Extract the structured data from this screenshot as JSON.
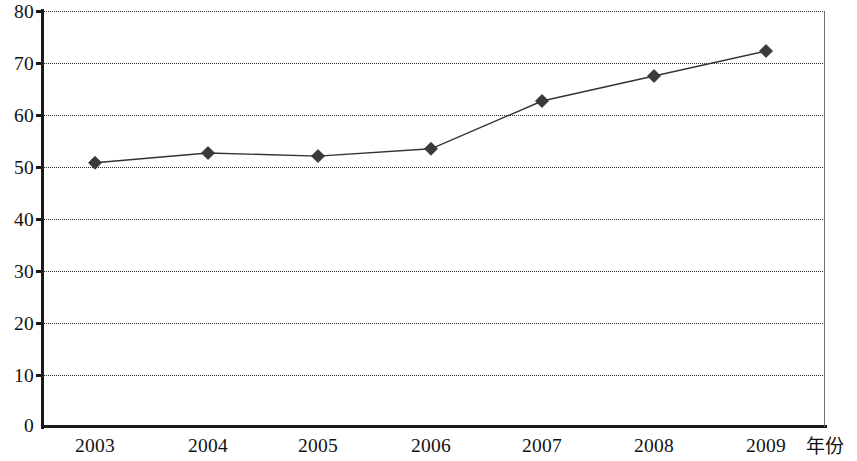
{
  "chart_data": {
    "type": "line",
    "title": "",
    "subtitle": "",
    "xlabel": "年份",
    "ylabel": "",
    "categories": [
      "2003",
      "2004",
      "2005",
      "2006",
      "2007",
      "2008",
      "2009"
    ],
    "values": [
      50.8,
      52.7,
      52.1,
      53.5,
      62.7,
      67.5,
      72.3
    ],
    "series": [
      {
        "name": "series-1",
        "values": [
          50.8,
          52.7,
          52.1,
          53.5,
          62.7,
          67.5,
          72.3
        ],
        "marker": "diamond",
        "line_color": "#333333",
        "marker_color": "#3a3a3a"
      }
    ],
    "xlim": [
      "2003",
      "2009"
    ],
    "ylim": [
      0,
      80
    ],
    "ytick_values": [
      0,
      10,
      20,
      30,
      40,
      50,
      60,
      70,
      80
    ],
    "ytick_labels": [
      "0",
      "10",
      "20",
      "30",
      "40",
      "50",
      "60",
      "70",
      "80"
    ],
    "xtick_labels": [
      "2003",
      "2004",
      "2005",
      "2006",
      "2007",
      "2008",
      "2009"
    ],
    "grid": true,
    "grid_axis": "y",
    "grid_style": "dotted",
    "legend": false,
    "legend_position": "none",
    "colors": {
      "axis": "#1a1a1a",
      "grid": "#2b2b2b",
      "plot_border": "#6f6f6f",
      "background": "#ffffff",
      "series": "#333333"
    }
  },
  "axis": {
    "x_title": "年份",
    "y_ticks": [
      {
        "value": 80,
        "label": "80"
      },
      {
        "value": 70,
        "label": "70"
      },
      {
        "value": 60,
        "label": "60"
      },
      {
        "value": 50,
        "label": "50"
      },
      {
        "value": 40,
        "label": "40"
      },
      {
        "value": 30,
        "label": "30"
      },
      {
        "value": 20,
        "label": "20"
      },
      {
        "value": 10,
        "label": "10"
      },
      {
        "value": 0,
        "label": "0"
      }
    ],
    "x_ticks": [
      {
        "label": "2003"
      },
      {
        "label": "2004"
      },
      {
        "label": "2005"
      },
      {
        "label": "2006"
      },
      {
        "label": "2007"
      },
      {
        "label": "2008"
      },
      {
        "label": "2009"
      }
    ]
  }
}
